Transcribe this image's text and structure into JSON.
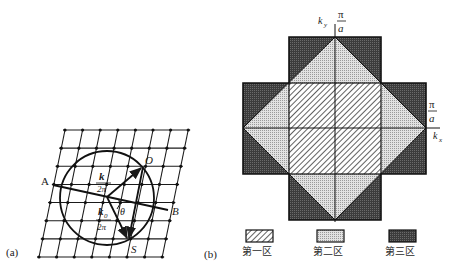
{
  "panel_a": {
    "label": "(a)",
    "lattice": {
      "rows": 8,
      "cols": 8,
      "origin_top_left": [
        65,
        130
      ],
      "origin_bottom_left": [
        39,
        257
      ],
      "spacing_x": 17.6,
      "spacing_y": 18.1
    },
    "sphere": {
      "center": [
        107,
        198
      ],
      "radius": 47
    },
    "points": {
      "A": "A",
      "B": "B",
      "O": "O",
      "S": "S"
    },
    "vector_k": {
      "num": "k",
      "den": "2π"
    },
    "vector_k0": {
      "num": "k",
      "sub": "0",
      "den": "2π"
    },
    "angle": "θ"
  },
  "panel_b": {
    "label": "(b)",
    "axes": {
      "ky": "k",
      "ky_sub": "y",
      "kx": "k",
      "kx_sub": "x",
      "ky_tick_num": "π",
      "ky_tick_den": "a",
      "kx_tick_num": "π",
      "kx_tick_den": "a"
    },
    "legend": [
      {
        "label": "第一区",
        "pattern": "hatch"
      },
      {
        "label": "第二区",
        "pattern": "dots"
      },
      {
        "label": "第三区",
        "pattern": "dark"
      }
    ],
    "colors": {
      "zone1_fill": "#ffffff",
      "zone1_hatch": "#3a3a3a",
      "zone2_fill": "#d9d9d9",
      "zone3_fill": "#4a4a4a",
      "line": "#1a1a1a"
    }
  }
}
